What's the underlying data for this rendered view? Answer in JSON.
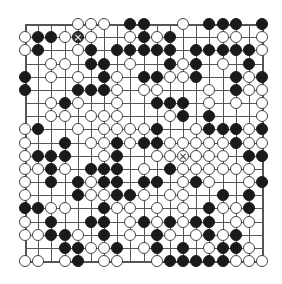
{
  "board": {
    "size": 19,
    "origin": {
      "x": 25,
      "y": 24
    },
    "spacing": 13.17,
    "colors": {
      "black": "#1a1a1a",
      "white": "#ffffff",
      "line": "#555555",
      "background": "#ffffff"
    },
    "legend": {
      "B": "black stone",
      "W": "white stone",
      "X": "marked black stone",
      "Y": "marked white stone",
      ".": "empty"
    },
    "rows": [
      "....WWW.BB..W.BBB.B",
      "WBBWXW..WBWB...WW.W",
      "WB..WB.BBBBB.BBBBBW",
      "..WW.BB.W..BWB.W.B.",
      "B.W.W.BW.BBWWB..BWB",
      "B...BBBW.WW...W.BWW",
      "..WBW..W..BBB.W.W.W",
      "..WW.WWW...WB.B...W",
      "WB..W.WWWWB..WBBBWB",
      "W..B.WWBWBBWWWWWBWW",
      "WBBB..WB..WWYWWW.BB",
      "WWBW.BBB.W.BWWWWWW.",
      "W.B.BWBB.BB.WBW..WB",
      "W...BWWBBW.WW..B.B.",
      "BBWW..BWW.W.W.BWWB.",
      "W.B..BB.WBWBWBB.WW.",
      "WWBBW.B.W.BW.WBWB..",
      "...BBWWB.WB.B.WBBW.",
      "WW.WB.WW..WBBBBBWWW"
    ]
  }
}
